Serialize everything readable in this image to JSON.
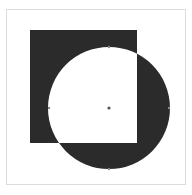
{
  "canvas": {
    "width": 192,
    "height": 195,
    "background": "#ffffff"
  },
  "frame": {
    "x": 6.5,
    "y": 9.5,
    "width": 179,
    "height": 175,
    "stroke": "#dcdcdc"
  },
  "square": {
    "x": 30,
    "y": 30,
    "width": 107,
    "height": 113
  },
  "circle": {
    "cx": 109,
    "cy": 108,
    "r": 61
  },
  "fill_rule": "xor",
  "colors": {
    "fill": "#2b2b2b",
    "anchor": "#8a8a8a",
    "center": "#555555"
  },
  "anchors": [
    {
      "name": "top",
      "x": 109,
      "y": 47
    },
    {
      "name": "left",
      "x": 49,
      "y": 108
    },
    {
      "name": "right",
      "x": 169,
      "y": 108
    },
    {
      "name": "bottom",
      "x": 109,
      "y": 169
    }
  ],
  "center_point": {
    "x": 109,
    "y": 108
  }
}
